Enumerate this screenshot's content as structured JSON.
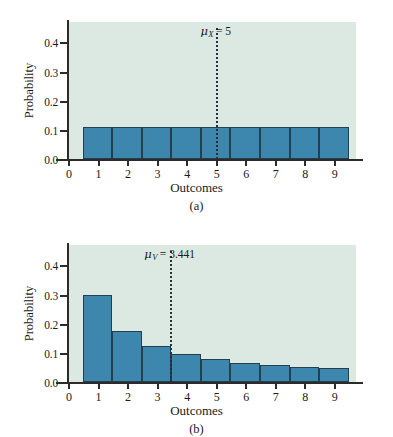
{
  "figure": {
    "background": "#ffffff",
    "plot_background": "#dce9e2",
    "bar_fill": "#3d86ad",
    "bar_stroke": "#24404f",
    "axis_color": "#2b2b2b"
  },
  "panels": [
    {
      "caption": "(a)",
      "xlabel": "Outcomes",
      "ylabel": "Probability",
      "mean_symbol": "μ",
      "mean_subscript": "X",
      "mean_equals": "= 5",
      "mean_label": "μX = 5",
      "mean_value": 5
    },
    {
      "caption": "(b)",
      "xlabel": "Outcomes",
      "ylabel": "Probability",
      "mean_symbol": "μ",
      "mean_subscript": "V",
      "mean_equals": "= 3.441",
      "mean_label": "μV = 3.441",
      "mean_value": 3.441
    }
  ],
  "yticks": [
    "0.0",
    "0.1",
    "0.2",
    "0.3",
    "0.4"
  ],
  "xticks": [
    "0",
    "1",
    "2",
    "3",
    "4",
    "5",
    "6",
    "7",
    "8",
    "9"
  ],
  "chart_data": [
    {
      "type": "bar",
      "title": "(a)",
      "xlabel": "Outcomes",
      "ylabel": "Probability",
      "categories": [
        1,
        2,
        3,
        4,
        5,
        6,
        7,
        8,
        9
      ],
      "values": [
        0.111,
        0.111,
        0.111,
        0.111,
        0.111,
        0.111,
        0.111,
        0.111,
        0.111
      ],
      "xlim": [
        0,
        9.75
      ],
      "ylim": [
        0.0,
        0.47
      ],
      "ytick_values": [
        0.0,
        0.1,
        0.2,
        0.3,
        0.4
      ],
      "xtick_values": [
        0,
        1,
        2,
        3,
        4,
        5,
        6,
        7,
        8,
        9
      ],
      "grid": false,
      "legend": false,
      "annotations": [
        {
          "text": "μX = 5",
          "type": "vertical-dotted-line",
          "x": 5
        }
      ]
    },
    {
      "type": "bar",
      "title": "(b)",
      "xlabel": "Outcomes",
      "ylabel": "Probability",
      "categories": [
        1,
        2,
        3,
        4,
        5,
        6,
        7,
        8,
        9
      ],
      "values": [
        0.3,
        0.175,
        0.125,
        0.097,
        0.079,
        0.066,
        0.059,
        0.053,
        0.048
      ],
      "xlim": [
        0,
        9.75
      ],
      "ylim": [
        0.0,
        0.47
      ],
      "ytick_values": [
        0.0,
        0.1,
        0.2,
        0.3,
        0.4
      ],
      "xtick_values": [
        0,
        1,
        2,
        3,
        4,
        5,
        6,
        7,
        8,
        9
      ],
      "grid": false,
      "legend": false,
      "annotations": [
        {
          "text": "μV = 3.441",
          "type": "vertical-dotted-line",
          "x": 3.441
        }
      ]
    }
  ]
}
